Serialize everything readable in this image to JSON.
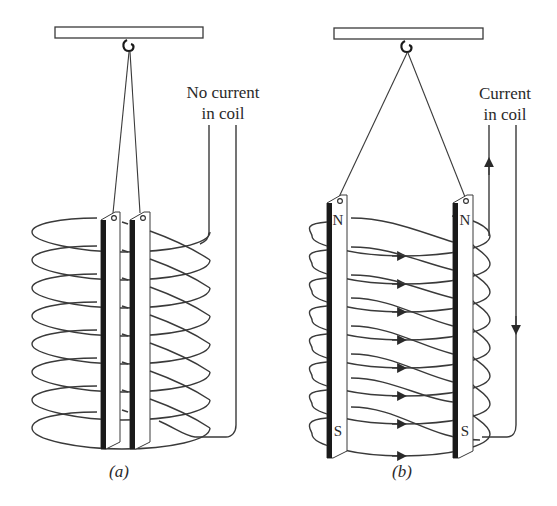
{
  "figure": {
    "panels": [
      {
        "id": "a",
        "caption": "(a)",
        "label_line1": "No current",
        "label_line2": "in coil",
        "state": "no-current",
        "bars": [
          {
            "top_pole": "",
            "bottom_pole": ""
          },
          {
            "top_pole": "",
            "bottom_pole": ""
          }
        ],
        "coil_turns": 8,
        "bar_behavior": "hang together (parallel, close)"
      },
      {
        "id": "b",
        "caption": "(b)",
        "label_line1": "Current",
        "label_line2": "in coil",
        "state": "current",
        "bars": [
          {
            "top_pole": "N",
            "bottom_pole": "S"
          },
          {
            "top_pole": "N",
            "bottom_pole": "S"
          }
        ],
        "coil_turns": 8,
        "bar_behavior": "repel (spread apart)",
        "current_arrows": [
          "up",
          "down"
        ]
      }
    ],
    "colors": {
      "line": "#3a3a3a",
      "bar_edge": "#1a1a1a",
      "background": "#ffffff"
    }
  }
}
